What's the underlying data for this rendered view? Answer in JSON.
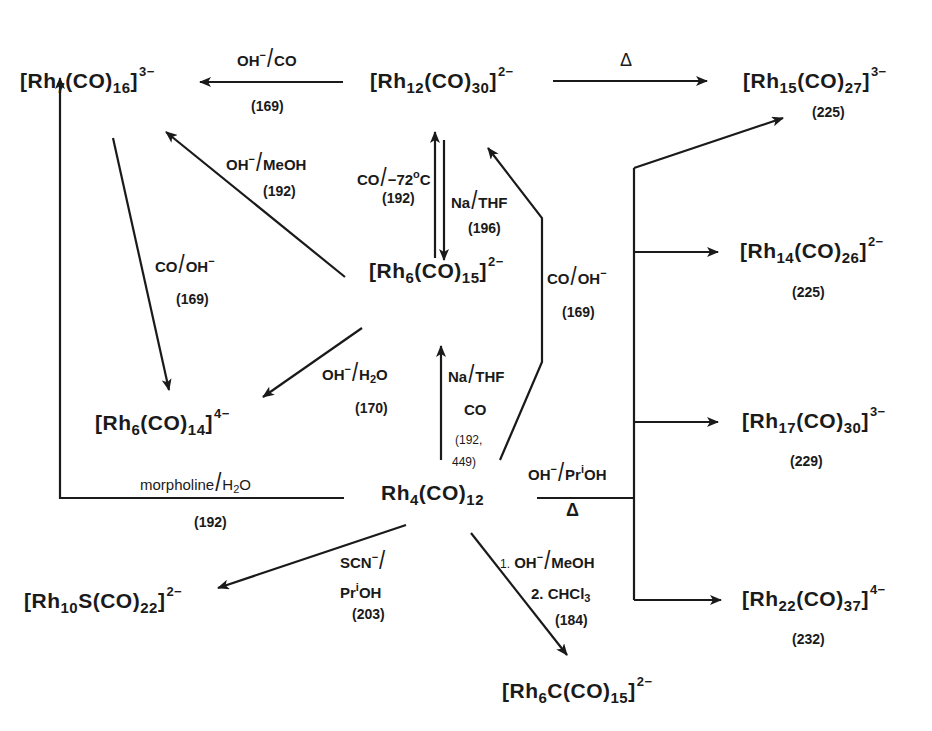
{
  "compounds": {
    "rh7": {
      "pre": "[Rh",
      "n": "7",
      "mid": "(CO)",
      "m": "16",
      "post": "]",
      "charge": "3−"
    },
    "rh12": {
      "pre": "[Rh",
      "n": "12",
      "mid": "(CO)",
      "m": "30",
      "post": "]",
      "charge": "2−"
    },
    "rh15": {
      "pre": "[Rh",
      "n": "15",
      "mid": "(CO)",
      "m": "27",
      "post": "]",
      "charge": "3−",
      "ref": "(225)"
    },
    "rh6co15": {
      "pre": "[Rh",
      "n": "6",
      "mid": "(CO)",
      "m": "15",
      "post": "]",
      "charge": "2−"
    },
    "rh14": {
      "pre": "[Rh",
      "n": "14",
      "mid": "(CO)",
      "m": "26",
      "post": "]",
      "charge": "2−",
      "ref": "(225)"
    },
    "rh6co14": {
      "pre": "[Rh",
      "n": "6",
      "mid": "(CO)",
      "m": "14",
      "post": "]",
      "charge": "4−"
    },
    "rh17": {
      "pre": "[Rh",
      "n": "17",
      "mid": "(CO)",
      "m": "30",
      "post": "]",
      "charge": "3−",
      "ref": "(229)"
    },
    "rh4": {
      "pre": "Rh",
      "n": "4",
      "mid": "(CO)",
      "m": "12"
    },
    "rh10s": {
      "pre": "[Rh",
      "n": "10",
      "mid": "S(CO)",
      "m": "22",
      "post": "]",
      "charge": "2−"
    },
    "rh22": {
      "pre": "[Rh",
      "n": "22",
      "mid": "(CO)",
      "m": "37",
      "post": "]",
      "charge": "4−",
      "ref": "(232)"
    },
    "rh6c": {
      "pre": "[Rh",
      "n": "6",
      "mid": "C(CO)",
      "m": "15",
      "post": "]",
      "charge": "2−"
    }
  },
  "reactions": {
    "rh12_to_rh7": {
      "reagent_a": "OH",
      "sup_a": "−",
      "reagent_b": "CO",
      "ref": "(169)"
    },
    "rh12_to_rh15": {
      "condition": "Δ"
    },
    "rh6_to_rh7": {
      "reagent_a": "OH",
      "sup_a": "−",
      "reagent_b": "MeOH",
      "ref": "(192)"
    },
    "rh12_to_rh6": {
      "reagent_a": "CO",
      "reagent_b": "−72",
      "sup_b": "o",
      "reagent_b_tail": "C",
      "ref": "(192)"
    },
    "rh6_to_rh12": {
      "reagent_a": "Na",
      "reagent_b": "THF",
      "ref": "(196)"
    },
    "rh7_to_rh6co14": {
      "reagent_a": "CO",
      "reagent_b": "OH",
      "sup_b": "−",
      "ref": "(169)"
    },
    "rh4_to_rh12": {
      "reagent_a": "CO",
      "reagent_b": "OH",
      "sup_b": "−",
      "ref": "(169)"
    },
    "rh6_to_rh6co14": {
      "reagent_a": "OH",
      "sup_a": "−",
      "reagent_b": "H",
      "sub_b": "2",
      "reagent_b_tail": "O",
      "ref": "(170)"
    },
    "rh4_to_rh6": {
      "reagent_a": "Na",
      "reagent_b": "THF",
      "line2": "CO",
      "ref_a": "(192,",
      "ref_b": "449)"
    },
    "rh4_to_rh7": {
      "reagent_a": "morpholine",
      "reagent_b": "H",
      "sub_b": "2",
      "reagent_b_tail": "O",
      "ref": "(192)"
    },
    "rh4_to_high": {
      "reagent_a": "OH",
      "sup_a": "−",
      "reagent_b": "Pr",
      "sup_b": "i",
      "reagent_b_tail": "OH",
      "condition": "Δ"
    },
    "rh4_to_rh10s": {
      "reagent_a": "SCN",
      "sup_a": "−",
      "reagent_b": "Pr",
      "sup_b": "i",
      "reagent_b_tail": "OH",
      "ref": "(203)"
    },
    "rh4_to_rh6c": {
      "step1_num": "1.",
      "reagent_a": "OH",
      "sup_a": "−",
      "reagent_b": "MeOH",
      "step2": "2. CHCl",
      "step2_sub": "3",
      "ref": "(184)"
    }
  },
  "colors": {
    "ink": "#1a1a1a",
    "background": "#ffffff"
  }
}
